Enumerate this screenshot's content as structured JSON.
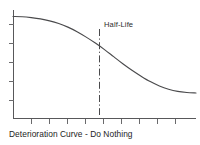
{
  "figure": {
    "caption": "Deterioration Curve - Do Nothing",
    "annotation_label": "Half-Life",
    "background_color": "#ffffff",
    "curve_color": "#4a4a4c",
    "axis_color": "#58585a",
    "marker_line_color": "#4a4a4c",
    "text_color": "#1d1d1d"
  },
  "chart_data": {
    "type": "line",
    "title": "Deterioration Curve - Do Nothing",
    "xlabel": "",
    "ylabel": "",
    "grid": false,
    "legend_position": "none",
    "axis_ranges": {
      "x": [
        0,
        10
      ],
      "y": [
        0,
        10
      ]
    },
    "x_tick_count": 10,
    "y_tick_count": 5,
    "x_tick_labels": [],
    "y_tick_labels": [],
    "series": [
      {
        "name": "Condition",
        "x": [
          0.0,
          0.5,
          1.0,
          1.5,
          2.0,
          2.5,
          3.0,
          3.5,
          4.0,
          4.5,
          5.0,
          5.5,
          6.0,
          6.5,
          7.0,
          7.5,
          8.0,
          8.5,
          9.0,
          9.5,
          10.0
        ],
        "values": [
          9.4,
          9.38,
          9.3,
          9.18,
          9.0,
          8.75,
          8.42,
          8.0,
          7.5,
          6.95,
          6.35,
          5.7,
          5.05,
          4.45,
          3.9,
          3.4,
          3.0,
          2.7,
          2.5,
          2.4,
          2.35
        ]
      }
    ],
    "annotations": [
      {
        "label": "Half-Life",
        "type": "vertical-dash-dot-line",
        "x": 5.0,
        "y_intersect": 6.35,
        "line_style": "dash-dot",
        "label_position": "top-right"
      }
    ]
  }
}
